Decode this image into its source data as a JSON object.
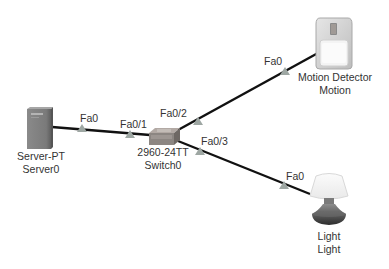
{
  "colors": {
    "link": "#111111",
    "port_triangle": "#9ea7a3",
    "text": "#333333",
    "background": "#ffffff"
  },
  "devices": [
    {
      "id": "server0",
      "icon": "server-icon",
      "model": "Server-PT",
      "name": "Server0"
    },
    {
      "id": "switch0",
      "icon": "switch-icon",
      "model": "2960-24TT",
      "name": "Switch0"
    },
    {
      "id": "motion",
      "icon": "motion-detector-icon",
      "model": "Motion Detector",
      "name": "Motion"
    },
    {
      "id": "light",
      "icon": "light-icon",
      "model": "Light",
      "name": "Light"
    }
  ],
  "links": [
    {
      "from": "Server0",
      "from_port": "Fa0",
      "to": "Switch0",
      "to_port": "Fa0/1"
    },
    {
      "from": "Switch0",
      "from_port": "Fa0/2",
      "to": "Motion",
      "to_port": "Fa0"
    },
    {
      "from": "Switch0",
      "from_port": "Fa0/3",
      "to": "Light",
      "to_port": "Fa0"
    }
  ]
}
